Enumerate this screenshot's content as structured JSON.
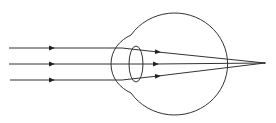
{
  "diagram": {
    "stroke_color": "#333333",
    "background": "#ffffff",
    "rays": [
      {
        "y_in": 48,
        "y_exit": 51
      },
      {
        "y_in": 64,
        "y_exit": 64
      },
      {
        "y_in": 80,
        "y_exit": 77
      }
    ],
    "focal_point": {
      "x": 265,
      "y": 63
    },
    "labels": []
  }
}
